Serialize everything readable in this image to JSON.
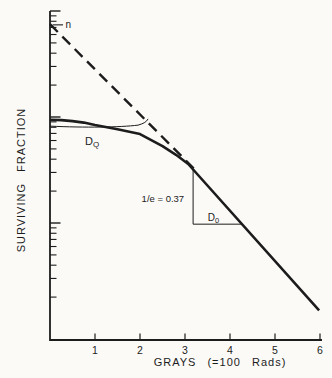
{
  "figure": {
    "background": "#fbfaf7",
    "ink": "#1c1c1c"
  },
  "chart_data": {
    "type": "line",
    "title": "",
    "xlabel": "GRAYS  (=100 Rads)",
    "ylabel": "SURVIVING  FRACTION",
    "x_axis": {
      "min": 0,
      "max": 6.05,
      "ticks": [
        1,
        2,
        3,
        4,
        5,
        6
      ],
      "tick_labels": [
        "1",
        "2",
        "3",
        "4",
        "5",
        "6"
      ]
    },
    "y_axis": {
      "scale": "log",
      "min": 0.008,
      "max": 10,
      "major_ticks": [
        10,
        1,
        0.1
      ],
      "minor_ticks": [
        9,
        8,
        7,
        6,
        5,
        4,
        3,
        2,
        0.9,
        0.8,
        0.7,
        0.6,
        0.5,
        0.4,
        0.3,
        0.2,
        0.09,
        0.08,
        0.07,
        0.06,
        0.05,
        0.04,
        0.03,
        0.02
      ],
      "tick_labels_shown": false
    },
    "grid": false,
    "legend": null,
    "series": [
      {
        "name": "survival-curve",
        "style": "solid",
        "points": [
          [
            0,
            0.94
          ],
          [
            0.25,
            0.935
          ],
          [
            0.5,
            0.915
          ],
          [
            0.75,
            0.885
          ],
          [
            1,
            0.84
          ],
          [
            1.5,
            0.765
          ],
          [
            2,
            0.69
          ],
          [
            2.5,
            0.53
          ],
          [
            2.8,
            0.44
          ],
          [
            3.07,
            0.36
          ],
          [
            5.98,
            0.015
          ]
        ]
      },
      {
        "name": "extrapolated-exponential",
        "style": "dashed",
        "points": [
          [
            0,
            7.5
          ],
          [
            3.2,
            0.325
          ]
        ]
      }
    ],
    "annotations": {
      "n_intercept": {
        "label": "n",
        "text_x": 0.345,
        "text_y": 7.4,
        "leader_x_start": 0.06,
        "leader_x_end": 0.29,
        "leader_y": 7.4
      },
      "dq": {
        "label_main": "D",
        "label_sub": "Q",
        "text_x": 0.78,
        "text_y": 0.55,
        "bracket": {
          "x_start": 0,
          "x_end": 2.18,
          "y_level": 0.82,
          "y_end": 0.96
        }
      },
      "inv_e": {
        "label": "1/e = 0.37",
        "text_x": 3.07,
        "text_y": 0.158
      },
      "d0": {
        "label_main": "D",
        "label_sub": "0",
        "text_x": 3.63,
        "text_y": 0.104,
        "triangle": {
          "x": 3.18,
          "y_top": 0.316,
          "y_bottom": 0.0975,
          "x_end": 4.26
        }
      }
    }
  }
}
